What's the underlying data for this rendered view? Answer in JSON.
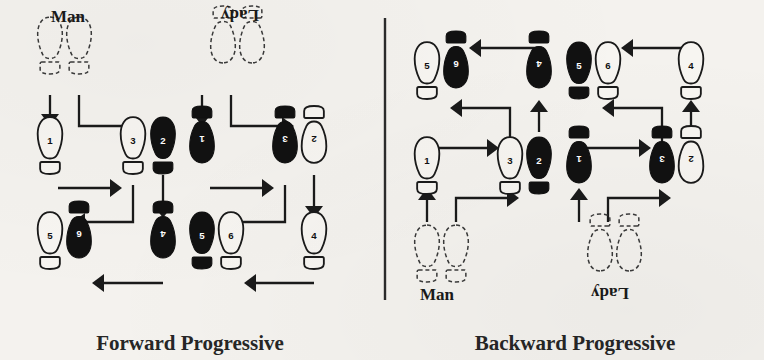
{
  "figure": {
    "background_color": "#f4f2ee",
    "ink_color": "#111111",
    "divider_x": 385
  },
  "panels": [
    {
      "id": "forward-progressive",
      "caption": "Forward Progressive",
      "caption_x": 190,
      "caption_y": 350,
      "roles": [
        {
          "id": "man",
          "label": "Man",
          "label_x": 68,
          "label_y": 22,
          "flipped": false,
          "start_feet": [
            {
              "x": 50,
              "y": 40,
              "rotate": 0,
              "side": "left"
            },
            {
              "x": 79,
              "y": 40,
              "rotate": 0,
              "side": "right"
            }
          ],
          "steps": [
            {
              "number": "1",
              "x": 50,
              "y": 140,
              "fill": "outline",
              "rotate": 0
            },
            {
              "number": "3",
              "x": 133,
              "y": 140,
              "fill": "outline",
              "rotate": 0
            },
            {
              "number": "2",
              "x": 163,
              "y": 140,
              "fill": "solid",
              "rotate": 0
            },
            {
              "number": "5",
              "x": 50,
              "y": 235,
              "fill": "outline",
              "rotate": 0
            },
            {
              "number": "6",
              "x": 79,
              "y": 235,
              "fill": "solid",
              "rotate": 180
            },
            {
              "number": "4",
              "x": 163,
              "y": 235,
              "fill": "solid",
              "rotate": 180
            }
          ],
          "arrows": [
            {
              "from": [
                50,
                95
              ],
              "to": [
                50,
                126
              ],
              "dir": "down",
              "elbow": null
            },
            {
              "from": [
                79,
                95
              ],
              "to": [
                142,
                126
              ],
              "dir": "right",
              "elbow": [
                79,
                126
              ]
            },
            {
              "from": [
                58,
                188
              ],
              "to": [
                122,
                188
              ],
              "dir": "right",
              "elbow": null
            },
            {
              "from": [
                163,
                175
              ],
              "to": [
                163,
                218
              ],
              "dir": "down",
              "elbow": null
            },
            {
              "from": [
                133,
                185
              ],
              "to": [
                73,
                222
              ],
              "dir": "left",
              "elbow": [
                133,
                222
              ]
            },
            {
              "from": [
                163,
                283
              ],
              "to": [
                92,
                283
              ],
              "dir": "left",
              "elbow": null
            }
          ]
        },
        {
          "id": "lady",
          "label": "Lady",
          "label_x": 240,
          "label_y": 22,
          "flipped": true,
          "start_feet": [
            {
              "x": 223,
              "y": 40,
              "rotate": 180,
              "side": "right"
            },
            {
              "x": 252,
              "y": 40,
              "rotate": 180,
              "side": "left"
            }
          ],
          "steps": [
            {
              "number": "1",
              "x": 202,
              "y": 140,
              "fill": "solid",
              "rotate": 180
            },
            {
              "number": "3",
              "x": 285,
              "y": 140,
              "fill": "solid",
              "rotate": 180
            },
            {
              "number": "2",
              "x": 314,
              "y": 140,
              "fill": "outline",
              "rotate": 180
            },
            {
              "number": "5",
              "x": 202,
              "y": 235,
              "fill": "solid",
              "rotate": 0
            },
            {
              "number": "6",
              "x": 231,
              "y": 235,
              "fill": "outline",
              "rotate": 0
            },
            {
              "number": "4",
              "x": 314,
              "y": 235,
              "fill": "outline",
              "rotate": 0
            }
          ],
          "arrows": [
            {
              "from": [
                202,
                95
              ],
              "to": [
                202,
                126
              ],
              "dir": "down",
              "elbow": null
            },
            {
              "from": [
                231,
                95
              ],
              "to": [
                294,
                126
              ],
              "dir": "right",
              "elbow": [
                231,
                126
              ]
            },
            {
              "from": [
                210,
                188
              ],
              "to": [
                274,
                188
              ],
              "dir": "right",
              "elbow": null
            },
            {
              "from": [
                314,
                175
              ],
              "to": [
                314,
                218
              ],
              "dir": "down",
              "elbow": null
            },
            {
              "from": [
                285,
                185
              ],
              "to": [
                225,
                222
              ],
              "dir": "left",
              "elbow": [
                285,
                222
              ]
            },
            {
              "from": [
                314,
                283
              ],
              "to": [
                244,
                283
              ],
              "dir": "left",
              "elbow": null
            }
          ]
        }
      ]
    },
    {
      "id": "backward-progressive",
      "caption": "Backward Progressive",
      "caption_x": 575,
      "caption_y": 350,
      "roles": [
        {
          "id": "man",
          "label": "Man",
          "label_x": 437,
          "label_y": 300,
          "flipped": false,
          "start_feet": [
            {
              "x": 427,
              "y": 248,
              "rotate": 0,
              "side": "left"
            },
            {
              "x": 456,
              "y": 248,
              "rotate": 0,
              "side": "right"
            }
          ],
          "steps": [
            {
              "number": "1",
              "x": 427,
              "y": 160,
              "fill": "outline",
              "rotate": 0
            },
            {
              "number": "3",
              "x": 510,
              "y": 160,
              "fill": "outline",
              "rotate": 0
            },
            {
              "number": "2",
              "x": 539,
              "y": 160,
              "fill": "solid",
              "rotate": 0
            },
            {
              "number": "5",
              "x": 427,
              "y": 65,
              "fill": "outline",
              "rotate": 0
            },
            {
              "number": "6",
              "x": 456,
              "y": 65,
              "fill": "solid",
              "rotate": 180
            },
            {
              "number": "4",
              "x": 539,
              "y": 65,
              "fill": "solid",
              "rotate": 180
            }
          ],
          "arrows": [
            {
              "from": [
                427,
                222
              ],
              "to": [
                427,
                188
              ],
              "dir": "up",
              "elbow": null
            },
            {
              "from": [
                456,
                222
              ],
              "to": [
                519,
                198
              ],
              "dir": "right",
              "elbow": [
                456,
                198
              ]
            },
            {
              "from": [
                435,
                148
              ],
              "to": [
                499,
                148
              ],
              "dir": "right",
              "elbow": null
            },
            {
              "from": [
                539,
                132
              ],
              "to": [
                539,
                100
              ],
              "dir": "up",
              "elbow": null
            },
            {
              "from": [
                510,
                142
              ],
              "to": [
                450,
                108
              ],
              "dir": "left",
              "elbow": [
                510,
                108
              ]
            },
            {
              "from": [
                539,
                48
              ],
              "to": [
                469,
                48
              ],
              "dir": "left",
              "elbow": null
            }
          ]
        },
        {
          "id": "lady",
          "label": "Lady",
          "label_x": 610,
          "label_y": 300,
          "flipped": true,
          "start_feet": [
            {
              "x": 600,
              "y": 248,
              "rotate": 180,
              "side": "right"
            },
            {
              "x": 629,
              "y": 248,
              "rotate": 180,
              "side": "left"
            }
          ],
          "steps": [
            {
              "number": "1",
              "x": 579,
              "y": 160,
              "fill": "solid",
              "rotate": 180
            },
            {
              "number": "3",
              "x": 662,
              "y": 160,
              "fill": "solid",
              "rotate": 180
            },
            {
              "number": "2",
              "x": 691,
              "y": 160,
              "fill": "outline",
              "rotate": 180
            },
            {
              "number": "5",
              "x": 579,
              "y": 65,
              "fill": "solid",
              "rotate": 0
            },
            {
              "number": "6",
              "x": 608,
              "y": 65,
              "fill": "outline",
              "rotate": 0
            },
            {
              "number": "4",
              "x": 691,
              "y": 65,
              "fill": "outline",
              "rotate": 0
            }
          ],
          "arrows": [
            {
              "from": [
                579,
                222
              ],
              "to": [
                579,
                188
              ],
              "dir": "up",
              "elbow": null
            },
            {
              "from": [
                608,
                222
              ],
              "to": [
                671,
                198
              ],
              "dir": "right",
              "elbow": [
                608,
                198
              ]
            },
            {
              "from": [
                587,
                148
              ],
              "to": [
                651,
                148
              ],
              "dir": "right",
              "elbow": null
            },
            {
              "from": [
                691,
                132
              ],
              "to": [
                691,
                100
              ],
              "dir": "up",
              "elbow": null
            },
            {
              "from": [
                662,
                142
              ],
              "to": [
                602,
                108
              ],
              "dir": "left",
              "elbow": [
                662,
                108
              ]
            },
            {
              "from": [
                691,
                48
              ],
              "to": [
                621,
                48
              ],
              "dir": "left",
              "elbow": null
            }
          ]
        }
      ]
    }
  ],
  "legend_semantics": {
    "solid_foot": "weighted step (shaded footprint)",
    "outline_foot": "unweighted step (open footprint)",
    "dashed_foot": "starting position",
    "step_count": 6
  }
}
